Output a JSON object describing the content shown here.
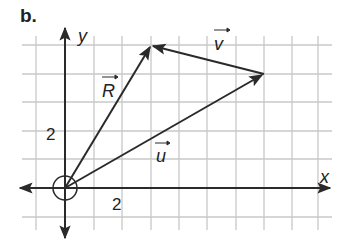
{
  "figure": {
    "part_label": "b.",
    "x_axis_label": "x",
    "y_axis_label": "y",
    "x_tick_label": "2",
    "y_tick_label": "2",
    "vectors": [
      {
        "name": "R",
        "label": "R",
        "from": [
          0,
          0
        ],
        "to": [
          3,
          5
        ]
      },
      {
        "name": "u",
        "label": "u",
        "from": [
          0,
          0
        ],
        "to": [
          7,
          4
        ]
      },
      {
        "name": "v",
        "label": "v",
        "from": [
          7,
          4
        ],
        "to": [
          3,
          5
        ]
      }
    ],
    "grid": {
      "x_range": [
        -1,
        9
      ],
      "y_range": [
        -1,
        5
      ],
      "unit_px": 28.5
    },
    "colors": {
      "grid": "#c8c8c8",
      "ink": "#2a2a2a"
    }
  }
}
